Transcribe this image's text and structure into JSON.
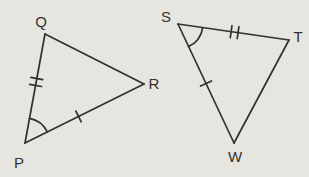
{
  "figure": {
    "width": 309,
    "height": 177,
    "background": "#e7e5e0",
    "line_color": "#33312d",
    "label_color": "#343230"
  },
  "style": {
    "stroke_width": 1.7,
    "tick_half_length": 6,
    "tick_gap": 7,
    "font_size": 15
  },
  "triangles": [
    {
      "name": "triangle-PQR",
      "vertices": [
        {
          "label": "P",
          "x": 25,
          "y": 143,
          "lx": 19,
          "ly": 168
        },
        {
          "label": "Q",
          "x": 45,
          "y": 34,
          "lx": 41,
          "ly": 27
        },
        {
          "label": "R",
          "x": 144,
          "y": 84,
          "lx": 154,
          "ly": 89
        }
      ],
      "sides": [
        {
          "from": "P",
          "to": "Q",
          "ticks": 2,
          "t": 0.56
        },
        {
          "from": "P",
          "to": "R",
          "ticks": 1,
          "t": 0.45
        },
        {
          "from": "Q",
          "to": "R",
          "ticks": 0,
          "t": 0.5
        }
      ],
      "angle_marks": [
        {
          "vertex": "P",
          "toward": [
            "Q",
            "R"
          ],
          "radius": 25
        }
      ]
    },
    {
      "name": "triangle-STW",
      "vertices": [
        {
          "label": "S",
          "x": 178,
          "y": 24,
          "lx": 166,
          "ly": 22
        },
        {
          "label": "T",
          "x": 289,
          "y": 40,
          "lx": 298,
          "ly": 42
        },
        {
          "label": "W",
          "x": 234,
          "y": 143,
          "lx": 235,
          "ly": 162
        }
      ],
      "sides": [
        {
          "from": "S",
          "to": "T",
          "ticks": 2,
          "t": 0.51
        },
        {
          "from": "S",
          "to": "W",
          "ticks": 1,
          "t": 0.5
        },
        {
          "from": "T",
          "to": "W",
          "ticks": 0,
          "t": 0.5
        }
      ],
      "angle_marks": [
        {
          "vertex": "S",
          "toward": [
            "T",
            "W"
          ],
          "radius": 25
        }
      ]
    }
  ]
}
